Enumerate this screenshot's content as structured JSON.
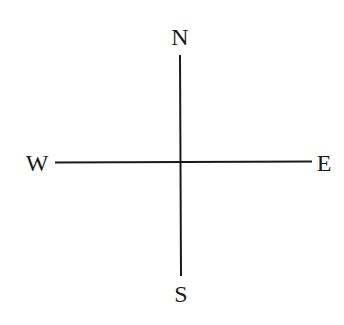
{
  "diagram": {
    "type": "compass-cross",
    "line_color": "#1a1a1a",
    "labels": {
      "north": "N",
      "south": "S",
      "east": "E",
      "west": "W"
    }
  }
}
